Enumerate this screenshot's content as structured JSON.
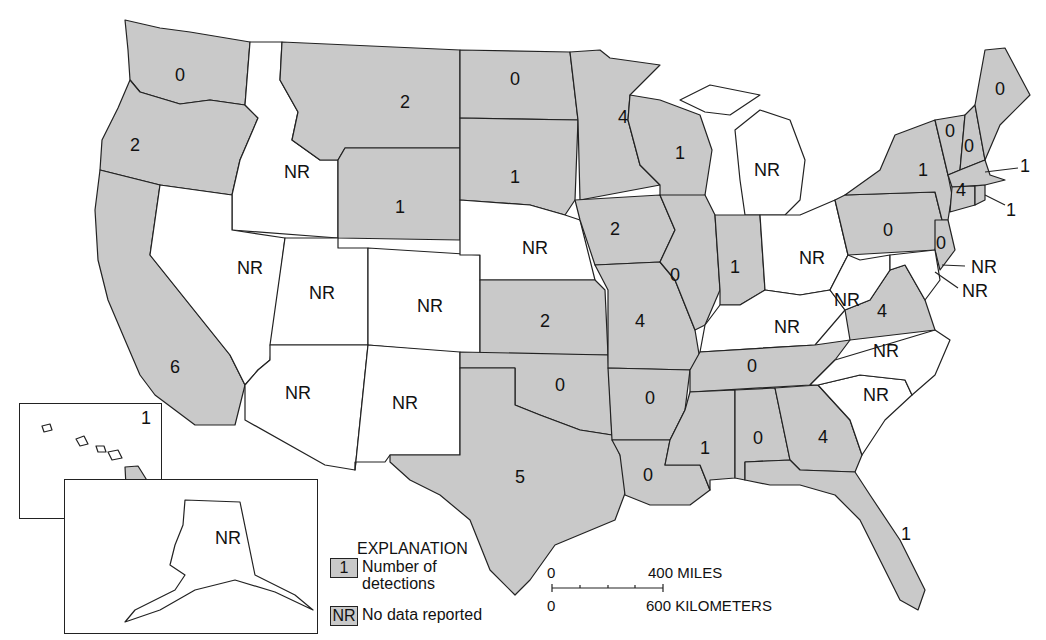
{
  "map": {
    "title": "Number of detections by state",
    "states": [
      {
        "state": "Washington",
        "value": "0",
        "x": 180,
        "y": 75
      },
      {
        "state": "Oregon",
        "value": "2",
        "x": 135,
        "y": 145
      },
      {
        "state": "California",
        "value": "6",
        "x": 175,
        "y": 367
      },
      {
        "state": "Idaho",
        "value": "NR",
        "x": 297,
        "y": 172
      },
      {
        "state": "Nevada",
        "value": "NR",
        "x": 250,
        "y": 268
      },
      {
        "state": "Montana",
        "value": "2",
        "x": 405,
        "y": 102
      },
      {
        "state": "Wyoming",
        "value": "1",
        "x": 400,
        "y": 207
      },
      {
        "state": "Utah",
        "value": "NR",
        "x": 322,
        "y": 293
      },
      {
        "state": "Colorado",
        "value": "NR",
        "x": 430,
        "y": 306
      },
      {
        "state": "Arizona",
        "value": "NR",
        "x": 298,
        "y": 393
      },
      {
        "state": "New Mexico",
        "value": "NR",
        "x": 405,
        "y": 403
      },
      {
        "state": "North Dakota",
        "value": "0",
        "x": 515,
        "y": 79
      },
      {
        "state": "South Dakota",
        "value": "1",
        "x": 515,
        "y": 177
      },
      {
        "state": "Nebraska",
        "value": "NR",
        "x": 535,
        "y": 248
      },
      {
        "state": "Kansas",
        "value": "2",
        "x": 545,
        "y": 321
      },
      {
        "state": "Oklahoma",
        "value": "0",
        "x": 560,
        "y": 385
      },
      {
        "state": "Texas",
        "value": "5",
        "x": 520,
        "y": 477
      },
      {
        "state": "Minnesota",
        "value": "4",
        "x": 623,
        "y": 117
      },
      {
        "state": "Iowa",
        "value": "2",
        "x": 615,
        "y": 229
      },
      {
        "state": "Missouri",
        "value": "4",
        "x": 640,
        "y": 321
      },
      {
        "state": "Arkansas",
        "value": "0",
        "x": 650,
        "y": 398
      },
      {
        "state": "Louisiana",
        "value": "0",
        "x": 648,
        "y": 475
      },
      {
        "state": "Wisconsin",
        "value": "1",
        "x": 680,
        "y": 153
      },
      {
        "state": "Illinois",
        "value": "0",
        "x": 675,
        "y": 275
      },
      {
        "state": "Michigan",
        "value": "NR",
        "x": 767,
        "y": 170
      },
      {
        "state": "Indiana",
        "value": "1",
        "x": 735,
        "y": 267
      },
      {
        "state": "Ohio",
        "value": "NR",
        "x": 812,
        "y": 258
      },
      {
        "state": "Kentucky",
        "value": "NR",
        "x": 787,
        "y": 327
      },
      {
        "state": "Tennessee",
        "value": "0",
        "x": 752,
        "y": 366
      },
      {
        "state": "Mississippi",
        "value": "1",
        "x": 705,
        "y": 448
      },
      {
        "state": "Alabama",
        "value": "0",
        "x": 758,
        "y": 438
      },
      {
        "state": "Georgia",
        "value": "4",
        "x": 823,
        "y": 437
      },
      {
        "state": "Florida",
        "value": "1",
        "x": 906,
        "y": 534
      },
      {
        "state": "South Carolina",
        "value": "NR",
        "x": 876,
        "y": 395
      },
      {
        "state": "North Carolina",
        "value": "NR",
        "x": 886,
        "y": 351
      },
      {
        "state": "Virginia",
        "value": "4",
        "x": 882,
        "y": 311
      },
      {
        "state": "West Virginia",
        "value": "NR",
        "x": 847,
        "y": 300
      },
      {
        "state": "Pennsylvania",
        "value": "0",
        "x": 888,
        "y": 230
      },
      {
        "state": "New York",
        "value": "1",
        "x": 923,
        "y": 170
      },
      {
        "state": "Vermont",
        "value": "0",
        "x": 950,
        "y": 131
      },
      {
        "state": "New Hampshire",
        "value": "0",
        "x": 969,
        "y": 146
      },
      {
        "state": "Maine",
        "value": "0",
        "x": 1000,
        "y": 89
      },
      {
        "state": "Connecticut",
        "value": "4",
        "x": 961,
        "y": 190
      },
      {
        "state": "New Jersey",
        "value": "0",
        "x": 941,
        "y": 243
      },
      {
        "state": "Massachusetts",
        "value": "1",
        "x": 1025,
        "y": 166,
        "callout": true
      },
      {
        "state": "Rhode Island",
        "value": "1",
        "x": 1011,
        "y": 210,
        "callout": true
      },
      {
        "state": "Delaware",
        "value": "NR",
        "x": 984,
        "y": 267,
        "callout": true
      },
      {
        "state": "Maryland",
        "value": "NR",
        "x": 975,
        "y": 291,
        "callout": true
      },
      {
        "state": "Hawaii",
        "value": "1",
        "x": 146,
        "y": 418
      },
      {
        "state": "Alaska",
        "value": "NR",
        "x": 228,
        "y": 538
      }
    ]
  },
  "legend": {
    "title": "EXPLANATION",
    "detections_swatch": "1",
    "detections_label_1": "Number of",
    "detections_label_2": "detections",
    "nr_swatch": "NR",
    "nr_label": "No data reported"
  },
  "scale": {
    "miles_zero": "0",
    "miles_label": "400 MILES",
    "km_zero": "0",
    "km_label": "600 KILOMETERS"
  },
  "colors": {
    "detected_fill": "#c9c9c9",
    "no_data_fill": "#ffffff",
    "outline": "#222222"
  }
}
